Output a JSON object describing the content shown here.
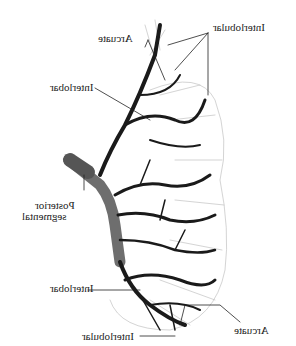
{
  "figure": {
    "labels": [
      {
        "id": "interlobular-top",
        "text": "Interlobular",
        "x": 213,
        "y": 28
      },
      {
        "id": "arcuate-top",
        "text": "Arcuate",
        "x": 98,
        "y": 38
      },
      {
        "id": "interlobar-top",
        "text": "Interlobar",
        "x": 52,
        "y": 87
      },
      {
        "id": "posterior-segmental-1",
        "text": "Posterior",
        "x": 33,
        "y": 205
      },
      {
        "id": "posterior-segmental-2",
        "text": "segmental",
        "x": 22,
        "y": 216
      },
      {
        "id": "interlobar-bottom",
        "text": "Interlobar",
        "x": 52,
        "y": 287
      },
      {
        "id": "arcuate-bottom",
        "text": "Arcuate",
        "x": 234,
        "y": 330
      },
      {
        "id": "interlobular-bottom",
        "text": "Interlobular",
        "x": 83,
        "y": 335
      }
    ],
    "colors": {
      "vessel": "#1a1a1a",
      "artery": "#6e6e6e",
      "background": "#ffffff",
      "text": "#222222"
    }
  }
}
